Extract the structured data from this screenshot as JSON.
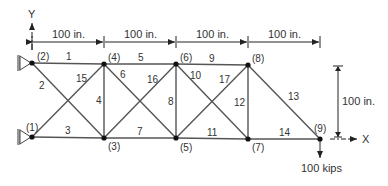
{
  "diagram": {
    "title": "",
    "axes": {
      "x_label": "X",
      "y_label": "Y"
    },
    "dimensions": {
      "horizontal": [
        "100 in.",
        "100 in.",
        "100 in.",
        "100 in."
      ],
      "vertical": "100 in."
    },
    "load": {
      "label": "100 kips",
      "node": 9,
      "direction": "down"
    },
    "nodes": [
      {
        "id": 1,
        "label": "(1)",
        "x": 32,
        "y": 137,
        "lx": 26,
        "ly": 131
      },
      {
        "id": 2,
        "label": "(2)",
        "x": 32,
        "y": 63,
        "lx": 37,
        "ly": 60
      },
      {
        "id": 3,
        "label": "(3)",
        "x": 104,
        "y": 138,
        "lx": 108,
        "ly": 150
      },
      {
        "id": 4,
        "label": "(4)",
        "x": 104,
        "y": 64,
        "lx": 108,
        "ly": 61
      },
      {
        "id": 5,
        "label": "(5)",
        "x": 176,
        "y": 138,
        "lx": 180,
        "ly": 151
      },
      {
        "id": 6,
        "label": "(6)",
        "x": 176,
        "y": 64,
        "lx": 180,
        "ly": 61
      },
      {
        "id": 7,
        "label": "(7)",
        "x": 248,
        "y": 139,
        "lx": 252,
        "ly": 151
      },
      {
        "id": 8,
        "label": "(8)",
        "x": 248,
        "y": 65,
        "lx": 252,
        "ly": 62
      },
      {
        "id": 9,
        "label": "(9)",
        "x": 320,
        "y": 139,
        "lx": 314,
        "ly": 132
      }
    ],
    "members": [
      {
        "id": 1,
        "label": "1",
        "from": 2,
        "to": 4,
        "lx": 66,
        "ly": 60
      },
      {
        "id": 2,
        "label": "2",
        "from": 2,
        "to": 3,
        "lx": 39,
        "ly": 89
      },
      {
        "id": 3,
        "label": "3",
        "from": 1,
        "to": 3,
        "lx": 65,
        "ly": 134
      },
      {
        "id": 4,
        "label": "4",
        "from": 3,
        "to": 4,
        "lx": 96,
        "ly": 104
      },
      {
        "id": 5,
        "label": "5",
        "from": 4,
        "to": 6,
        "lx": 138,
        "ly": 61
      },
      {
        "id": 6,
        "label": "6",
        "from": 4,
        "to": 5,
        "lx": 120,
        "ly": 78
      },
      {
        "id": 7,
        "label": "7",
        "from": 3,
        "to": 5,
        "lx": 137,
        "ly": 135
      },
      {
        "id": 8,
        "label": "8",
        "from": 5,
        "to": 6,
        "lx": 168,
        "ly": 105
      },
      {
        "id": 9,
        "label": "9",
        "from": 6,
        "to": 8,
        "lx": 209,
        "ly": 62
      },
      {
        "id": 10,
        "label": "10",
        "from": 6,
        "to": 7,
        "lx": 190,
        "ly": 79
      },
      {
        "id": 11,
        "label": "11",
        "from": 5,
        "to": 7,
        "lx": 207,
        "ly": 136
      },
      {
        "id": 12,
        "label": "12",
        "from": 7,
        "to": 8,
        "lx": 234,
        "ly": 106
      },
      {
        "id": 13,
        "label": "13",
        "from": 8,
        "to": 9,
        "lx": 288,
        "ly": 100
      },
      {
        "id": 14,
        "label": "14",
        "from": 7,
        "to": 9,
        "lx": 279,
        "ly": 136
      },
      {
        "id": 15,
        "label": "15",
        "from": 1,
        "to": 4,
        "lx": 76,
        "ly": 82
      },
      {
        "id": 16,
        "label": "16",
        "from": 3,
        "to": 6,
        "lx": 147,
        "ly": 83
      },
      {
        "id": 17,
        "label": "17",
        "from": 5,
        "to": 8,
        "lx": 219,
        "ly": 83
      }
    ],
    "colors": {
      "line": "#555555",
      "node": "#111111",
      "text": "#333333",
      "support": "#888888"
    }
  }
}
